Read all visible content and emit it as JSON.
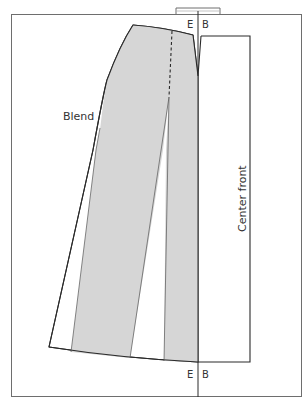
{
  "diagram": {
    "type": "sewing-pattern",
    "labels": {
      "top_left_marker": "E",
      "top_right_marker": "B",
      "bottom_left_marker": "E",
      "bottom_right_marker": "B",
      "blend": "Blend",
      "center_front": "Center front"
    },
    "colors": {
      "frame": "#6e6e6e",
      "outline": "#2a2a2a",
      "panel_fill": "#d6d6d6",
      "panel_edge": "#555555",
      "text": "#333333"
    }
  }
}
